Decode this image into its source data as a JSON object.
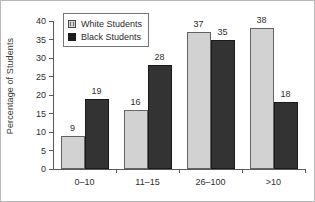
{
  "chart_data": {
    "type": "bar",
    "title": "",
    "xlabel": "",
    "ylabel": "Percentage of Students",
    "categories": [
      "0–10",
      "11–15",
      "26–100",
      ">10"
    ],
    "series": [
      {
        "name": "White Students",
        "color": "#d2d2d2",
        "values": [
          9,
          16,
          37,
          38
        ]
      },
      {
        "name": "Black Students",
        "color": "#333333",
        "values": [
          19,
          28,
          35,
          18
        ]
      }
    ],
    "ylim": [
      0,
      40
    ],
    "yticks": [
      0,
      5,
      10,
      15,
      20,
      25,
      30,
      35,
      40
    ],
    "ytick_labels": [
      "0",
      "5",
      "10",
      "15",
      "20",
      "25",
      "30",
      "35",
      "40"
    ],
    "grid": false,
    "legend_position": "upper-left-inside",
    "data_labels": true
  },
  "legend": {
    "items": [
      {
        "label": "White Students",
        "swatch": "white-swatch"
      },
      {
        "label": "Black Students",
        "swatch": "black-swatch"
      }
    ]
  }
}
